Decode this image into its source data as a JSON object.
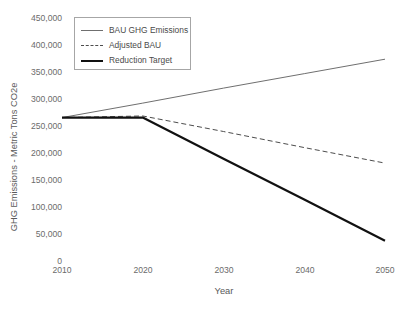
{
  "chart_data": {
    "type": "line",
    "title": "",
    "xlabel": "Year",
    "ylabel": "GHG Emissions - Metric Tons CO2e",
    "x": [
      2010,
      2020,
      2030,
      2040,
      2050
    ],
    "xlim": [
      2010,
      2050
    ],
    "ylim": [
      0,
      450000
    ],
    "xticks": [
      "2010",
      "2020",
      "2030",
      "2040",
      "2050"
    ],
    "yticks": [
      "0",
      "50,000",
      "100,000",
      "150,000",
      "200,000",
      "250,000",
      "300,000",
      "350,000",
      "400,000",
      "450,000"
    ],
    "ytick_values": [
      0,
      50000,
      100000,
      150000,
      200000,
      250000,
      300000,
      350000,
      400000,
      450000
    ],
    "grid": false,
    "legend_position": "upper-left",
    "series": [
      {
        "name": "BAU GHG Emissions",
        "style": "solid",
        "color": "#6f6f6f",
        "width": 1,
        "values": [
          265000,
          292000,
          320000,
          347000,
          374000
        ]
      },
      {
        "name": "Adjusted BAU",
        "style": "dashed",
        "color": "#4d4d4d",
        "width": 1,
        "values": [
          265000,
          268000,
          239000,
          209000,
          180000
        ]
      },
      {
        "name": "Reduction Target",
        "style": "solid",
        "color": "#111111",
        "width": 2.2,
        "values": [
          265000,
          265000,
          188000,
          112000,
          35000
        ]
      }
    ]
  },
  "legend": {
    "items": [
      {
        "label": "BAU GHG Emissions"
      },
      {
        "label": "Adjusted BAU"
      },
      {
        "label": "Reduction Target"
      }
    ]
  }
}
